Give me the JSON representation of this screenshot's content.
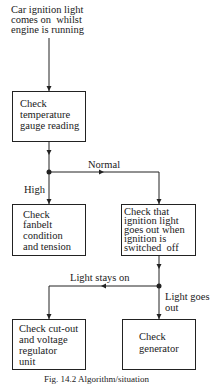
{
  "diagram": {
    "type": "flowchart",
    "start": {
      "lines": [
        "Car ignition light",
        "comes on  whilst",
        "engine is running"
      ]
    },
    "nodes": [
      {
        "id": "temp",
        "lines": [
          "Check",
          "temperature",
          "gauge reading"
        ]
      },
      {
        "id": "fanbelt",
        "lines": [
          "Check",
          "fanbelt",
          "condition",
          "and tension"
        ]
      },
      {
        "id": "ignition",
        "lines": [
          "Check that",
          "ignition light",
          "goes out when",
          "ignition is",
          "switched  off"
        ]
      },
      {
        "id": "cutout",
        "lines": [
          "Check cut-out",
          "and voltage",
          "regulator",
          "unit"
        ]
      },
      {
        "id": "generator",
        "lines": [
          "Check",
          "generator"
        ]
      }
    ],
    "edge_labels": {
      "normal": "Normal",
      "high": "High",
      "light_stays_on": "Light stays on",
      "light_goes_out_1": "Light goes",
      "light_goes_out_2": "out"
    },
    "edges": [
      {
        "from": "start",
        "to": "temp"
      },
      {
        "from": "temp",
        "to": "fanbelt",
        "label": "High"
      },
      {
        "from": "temp",
        "to": "ignition",
        "label": "Normal"
      },
      {
        "from": "ignition",
        "to": "cutout",
        "label": "Light stays on"
      },
      {
        "from": "ignition",
        "to": "generator",
        "label": "Light goes out"
      }
    ],
    "caption": "Fig. 14.2   Algorithm/situation"
  }
}
